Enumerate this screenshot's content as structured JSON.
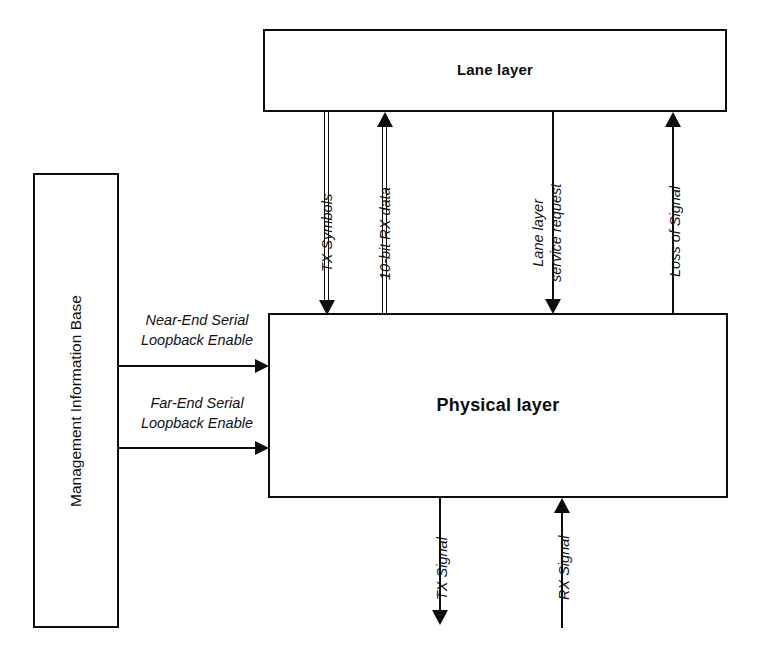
{
  "diagram": {
    "title_implicit": "Lane layer / Physical layer interface block diagram",
    "background_color": "#ffffff",
    "line_color": "#0d0d0d",
    "boxes": [
      {
        "id": "lane-layer",
        "label": "Lane layer"
      },
      {
        "id": "physical-layer",
        "label": "Physical layer"
      },
      {
        "id": "mib",
        "label": "Management Information Base"
      }
    ],
    "connectors": [
      {
        "id": "tx-symbols",
        "label": "TX Symbols",
        "style": "double-line",
        "direction": "down",
        "from": "lane-layer",
        "to": "physical-layer"
      },
      {
        "id": "ten-bit-rx-data",
        "label": "10-bit RX data",
        "style": "double-line",
        "direction": "up",
        "from": "physical-layer",
        "to": "lane-layer"
      },
      {
        "id": "lane-layer-service-request",
        "label": "Lane layer\nservice request",
        "style": "single-line",
        "direction": "down",
        "from": "lane-layer",
        "to": "physical-layer"
      },
      {
        "id": "loss-of-signal",
        "label": "Loss of Signal",
        "style": "single-line",
        "direction": "up",
        "from": "physical-layer",
        "to": "lane-layer"
      },
      {
        "id": "near-end-serial-loopback",
        "label": "Near-End Serial\nLoopback Enable",
        "style": "single-line",
        "direction": "right",
        "from": "mib",
        "to": "physical-layer"
      },
      {
        "id": "far-end-serial-loopback",
        "label": "Far-End Serial\nLoopback Enable",
        "style": "single-line",
        "direction": "right",
        "from": "mib",
        "to": "physical-layer"
      },
      {
        "id": "tx-signal",
        "label": "TX Signal",
        "style": "single-line",
        "direction": "down",
        "from": "physical-layer",
        "to": "external"
      },
      {
        "id": "rx-signal",
        "label": "RX Signal",
        "style": "single-line",
        "direction": "up",
        "from": "external",
        "to": "physical-layer"
      }
    ]
  }
}
